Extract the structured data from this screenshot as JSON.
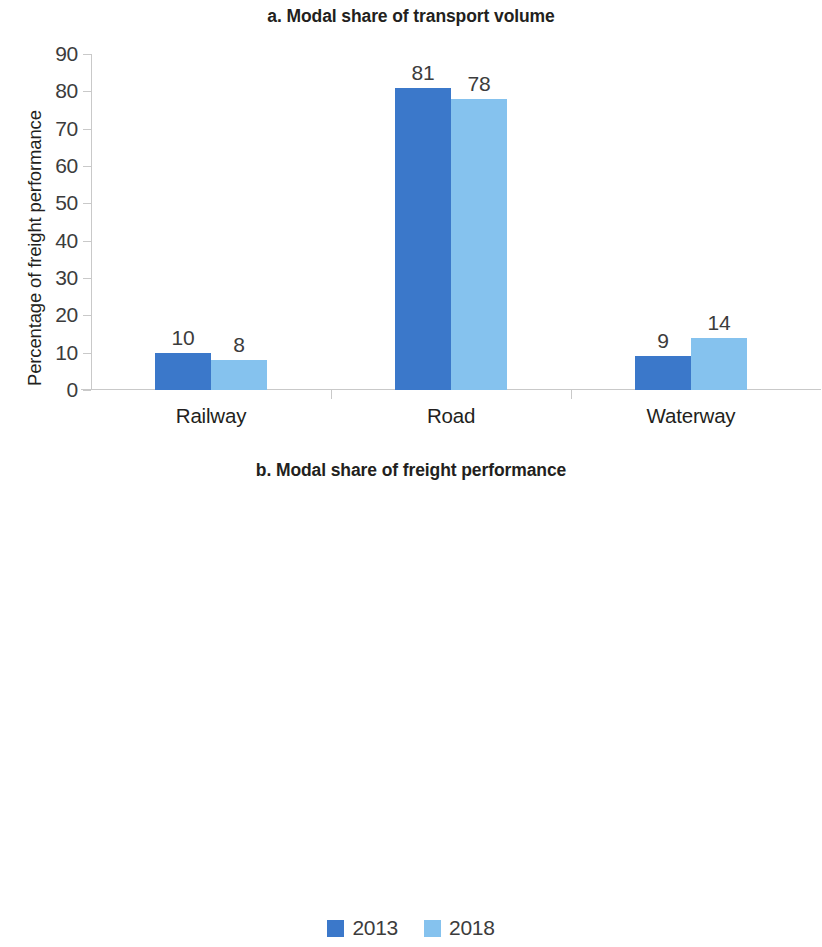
{
  "colors": {
    "series_2013": "#3b78ca",
    "series_2018": "#85c2ee",
    "axis": "#c9c9c9",
    "text": "#231f20"
  },
  "legend": {
    "position": "bottom-center",
    "items": [
      {
        "label": "2013",
        "color": "#3b78ca"
      },
      {
        "label": "2018",
        "color": "#85c2ee"
      }
    ]
  },
  "chart_data": [
    {
      "id": "a",
      "type": "bar",
      "title": "a. Modal share of transport volume",
      "xlabel": "",
      "ylabel": "Percentage of freight performance",
      "categories": [
        "Railway",
        "Road",
        "Waterway"
      ],
      "ylim": [
        0,
        90
      ],
      "yticks": [
        0,
        10,
        20,
        30,
        40,
        50,
        60,
        70,
        80,
        90
      ],
      "ytick_labels": [
        "0",
        "10",
        "20",
        "30",
        "40",
        "50",
        "60",
        "70",
        "80",
        "90"
      ],
      "grid": false,
      "series": [
        {
          "name": "2013",
          "color": "#3b78ca",
          "values": [
            10,
            81,
            9
          ],
          "labels": [
            "10",
            "81",
            "9"
          ]
        },
        {
          "name": "2018",
          "color": "#85c2ee",
          "values": [
            8,
            78,
            14
          ],
          "labels": [
            "8",
            "78",
            "14"
          ]
        }
      ]
    },
    {
      "id": "b",
      "type": "bar",
      "title": "b. Modal share of freight performance",
      "xlabel": "",
      "ylabel": "Percentage of freight performance",
      "categories": [
        "Railway",
        "Road",
        "Waterway"
      ],
      "ylim": [
        0,
        60
      ],
      "yticks": [
        0,
        10,
        20,
        30,
        40,
        50,
        60
      ],
      "ytick_labels": [
        "0",
        "10",
        "20",
        "30",
        "40",
        "50",
        "60"
      ],
      "grid": false,
      "series": [
        {
          "name": "2013",
          "color": "#3b78ca",
          "values": [
            18,
            34,
            48
          ],
          "labels": [
            "18",
            "34",
            "48"
          ]
        },
        {
          "name": "2018",
          "color": "#85c2ee",
          "values": [
            15,
            36,
            50
          ],
          "labels": [
            "15",
            "36",
            "50"
          ]
        }
      ]
    }
  ]
}
